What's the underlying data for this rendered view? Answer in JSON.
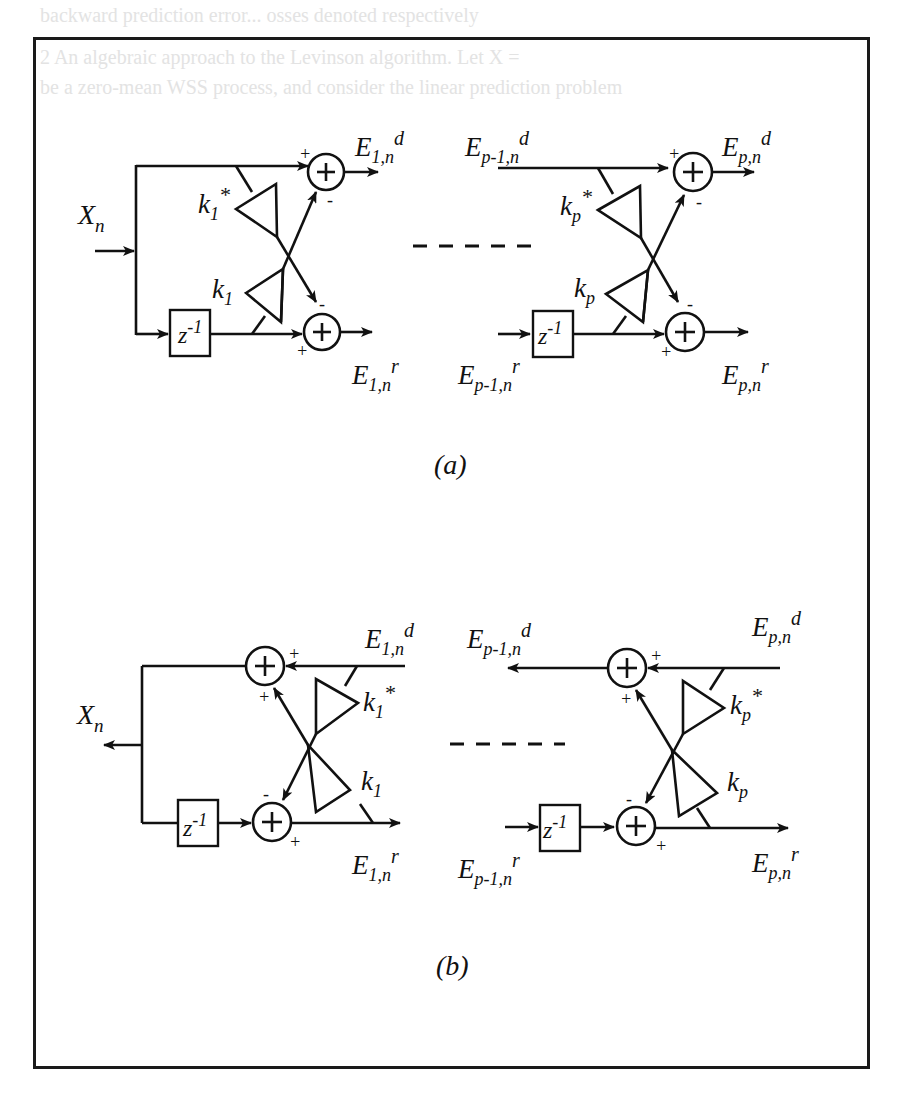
{
  "background_text": {
    "line_top": "backward prediction error... osses denoted respectively",
    "line_2": "2  An algebraic approach to the Levinson algorithm. Let X =",
    "line_3": "be a zero-mean WSS process, and consider the linear prediction problem"
  },
  "figure_a": {
    "caption": "(a)",
    "input_label": "X",
    "input_sub": "n",
    "stage1": {
      "out_fwd": {
        "base": "E",
        "sub": "1,n",
        "sup": "d"
      },
      "out_bwd": {
        "base": "E",
        "sub": "1,n",
        "sup": "r"
      },
      "gain_top": {
        "base": "k",
        "sub": "1",
        "sup": "*"
      },
      "gain_bot": {
        "base": "k",
        "sub": "1",
        "sup": ""
      },
      "delay": {
        "base": "z",
        "sup": "-1"
      },
      "signs": {
        "top_in": "+",
        "top_cross": "-",
        "bot_cross": "-",
        "bot_in": "+"
      }
    },
    "stagep": {
      "in_fwd": {
        "base": "E",
        "sub": "p-1,n",
        "sup": "d"
      },
      "in_bwd": {
        "base": "E",
        "sub": "p-1,n",
        "sup": "r"
      },
      "out_fwd": {
        "base": "E",
        "sub": "p,n",
        "sup": "d"
      },
      "out_bwd": {
        "base": "E",
        "sub": "p,n",
        "sup": "r"
      },
      "gain_top": {
        "base": "k",
        "sub": "p",
        "sup": "*"
      },
      "gain_bot": {
        "base": "k",
        "sub": "p",
        "sup": ""
      },
      "delay": {
        "base": "z",
        "sup": "-1"
      },
      "signs": {
        "top_in": "+",
        "top_cross": "-",
        "bot_cross": "-",
        "bot_in": "+"
      }
    }
  },
  "figure_b": {
    "caption": "(b)",
    "output_label": "X",
    "output_sub": "n",
    "stage1": {
      "in_fwd": {
        "base": "E",
        "sub": "1,n",
        "sup": "d"
      },
      "out_bwd": {
        "base": "E",
        "sub": "1,n",
        "sup": "r"
      },
      "gain_top": {
        "base": "k",
        "sub": "1",
        "sup": "*"
      },
      "gain_bot": {
        "base": "k",
        "sub": "1",
        "sup": ""
      },
      "delay": {
        "base": "z",
        "sup": "-1"
      },
      "signs": {
        "top_in": "+",
        "top_cross": "+",
        "bot_cross": "-",
        "bot_in": "+"
      }
    },
    "stagep": {
      "out_fwd": {
        "base": "E",
        "sub": "p-1,n",
        "sup": "d"
      },
      "in_bwd": {
        "base": "E",
        "sub": "p-1,n",
        "sup": "r"
      },
      "in_fwd": {
        "base": "E",
        "sub": "p,n",
        "sup": "d"
      },
      "out_bwd": {
        "base": "E",
        "sub": "p,n",
        "sup": "r"
      },
      "gain_top": {
        "base": "k",
        "sub": "p",
        "sup": "*"
      },
      "gain_bot": {
        "base": "k",
        "sub": "p",
        "sup": ""
      },
      "delay": {
        "base": "z",
        "sup": "-1"
      },
      "signs": {
        "top_in": "+",
        "top_cross": "+",
        "bot_cross": "-",
        "bot_in": "+"
      }
    }
  },
  "colors": {
    "ink": "#111111",
    "frame": "#1a1a1a",
    "paper": "#ffffff",
    "ghost": "#e3e3e3"
  }
}
